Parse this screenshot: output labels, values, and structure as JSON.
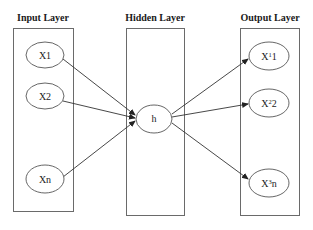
{
  "diagram": {
    "layers": [
      {
        "title": "Input Layer",
        "nodes": [
          {
            "label": "X1"
          },
          {
            "label": "X2"
          },
          {
            "label": "Xn"
          }
        ]
      },
      {
        "title": "Hidden Layer",
        "nodes": [
          {
            "label": "h"
          }
        ]
      },
      {
        "title": "Output Layer",
        "nodes": [
          {
            "base": "X",
            "sup": "1",
            "sub": "1"
          },
          {
            "base": "X",
            "sup": "2",
            "sub": "2"
          },
          {
            "base": "X",
            "sup": "3",
            "sub": "n"
          }
        ]
      }
    ],
    "edges": [
      {
        "from": "X1",
        "to": "h"
      },
      {
        "from": "X2",
        "to": "h"
      },
      {
        "from": "Xn",
        "to": "h"
      },
      {
        "from": "h",
        "to": "X11"
      },
      {
        "from": "h",
        "to": "X22"
      },
      {
        "from": "h",
        "to": "X3n"
      }
    ],
    "colors": {
      "box_stroke": "#6a6a6a",
      "node_stroke": "#555555",
      "edge": "#333333",
      "background": "#ffffff"
    }
  }
}
